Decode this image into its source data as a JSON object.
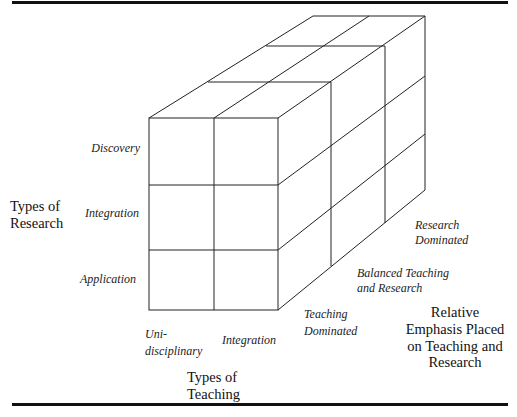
{
  "diagram": {
    "type": "3d-cube-matrix",
    "axes": {
      "vertical": {
        "title_line1": "Types of",
        "title_line2": "Research",
        "levels": [
          "Discovery",
          "Integration",
          "Application"
        ]
      },
      "horizontal": {
        "title_line1": "Types of",
        "title_line2": "Teaching",
        "levels": [
          "Uni-",
          "disciplinary",
          "Integration"
        ],
        "level_labels": {
          "unidisciplinary_line1": "Uni-",
          "unidisciplinary_line2": "disciplinary",
          "integration": "Integration"
        }
      },
      "depth": {
        "title_lines": [
          "Relative",
          "Emphasis Placed",
          "on Teaching and",
          "Research"
        ],
        "levels": {
          "teaching_line1": "Teaching",
          "teaching_line2": "Dominated",
          "balanced_line1": "Balanced Teaching",
          "balanced_line2": "and Research",
          "research_line1": "Research",
          "research_line2": "Dominated"
        }
      }
    },
    "grid": {
      "rows": 3,
      "columns": 2,
      "depth_layers": 3
    },
    "line_color": "#222222"
  }
}
